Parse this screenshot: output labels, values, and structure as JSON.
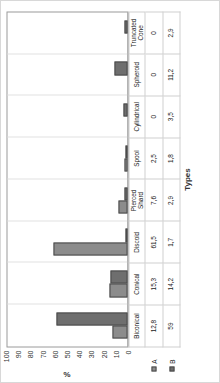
{
  "chart_data": {
    "type": "bar",
    "title": "",
    "xlabel": "Types",
    "ylabel": "%",
    "ylim": [
      0,
      100
    ],
    "yticks": [
      100,
      90,
      80,
      70,
      60,
      50,
      40,
      30,
      20,
      10,
      0
    ],
    "grid": false,
    "orientation": "rotated-90-ccw",
    "legend_position": "data-table-row-labels",
    "categories": [
      "Biconical",
      "Conical",
      "Discoid",
      "Pierced Shard",
      "Spool",
      "Cylindrical",
      "Spheroid",
      "Truncated Cone"
    ],
    "series": [
      {
        "name": "A",
        "color": "#8c8c8c",
        "values": [
          12.8,
          15.3,
          61.5,
          7.6,
          2.5,
          0,
          0,
          0
        ],
        "labels": [
          "12,8",
          "15,3",
          "61,5",
          "7,6",
          "2,5",
          "0",
          "0",
          "0"
        ]
      },
      {
        "name": "B",
        "color": "#6e6e6e",
        "values": [
          59,
          14.2,
          1.7,
          2.9,
          1.8,
          3.5,
          11.2,
          2.9
        ],
        "labels": [
          "59",
          "14,2",
          "1,7",
          "2,9",
          "1,8",
          "3,5",
          "11,2",
          "2,9"
        ]
      }
    ]
  },
  "colors": {
    "series_a": "#8c8c8c",
    "series_b": "#6e6e6e",
    "bar_border": "#4a4a4a",
    "axis": "#9a9a9a",
    "grid_line": "#e2e2e2",
    "text": "#1a1a1a"
  }
}
